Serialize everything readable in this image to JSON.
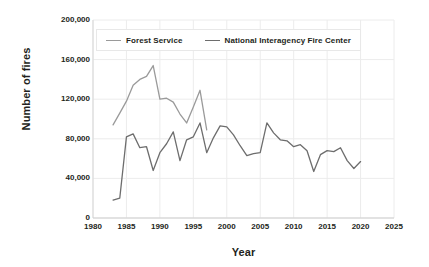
{
  "chart_data": {
    "type": "line",
    "title": "",
    "xlabel": "Year",
    "ylabel": "Number of fires",
    "xlim": [
      1980,
      2025
    ],
    "ylim": [
      0,
      200000
    ],
    "xticks": [
      1980,
      1985,
      1990,
      1995,
      2000,
      2005,
      2010,
      2015,
      2020,
      2025
    ],
    "xtick_labels": [
      "1980",
      "1985",
      "1990",
      "1995",
      "2000",
      "2005",
      "2010",
      "2015",
      "2020",
      "2025"
    ],
    "yticks": [
      0,
      40000,
      80000,
      120000,
      160000,
      200000
    ],
    "ytick_labels": [
      "0",
      "40,000",
      "80,000",
      "120,000",
      "160,000",
      "200,000"
    ],
    "grid": true,
    "legend_position": "top-left-inside",
    "series": [
      {
        "name": "Forest Service",
        "color": "#9a9a9a",
        "x": [
          1983,
          1984,
          1985,
          1986,
          1987,
          1988,
          1989,
          1990,
          1991,
          1992,
          1993,
          1994,
          1995,
          1996,
          1997
        ],
        "values": [
          94000,
          106000,
          118000,
          134000,
          140000,
          143000,
          154000,
          120000,
          121000,
          117000,
          105000,
          96000,
          112000,
          129000,
          89000
        ]
      },
      {
        "name": "National Interagency Fire Center",
        "color": "#6d6d6d",
        "x": [
          1983,
          1984,
          1985,
          1986,
          1987,
          1988,
          1989,
          1990,
          1991,
          1992,
          1993,
          1994,
          1995,
          1996,
          1997,
          1998,
          1999,
          2000,
          2001,
          2002,
          2003,
          2004,
          2005,
          2006,
          2007,
          2008,
          2009,
          2010,
          2011,
          2012,
          2013,
          2014,
          2015,
          2016,
          2017,
          2018,
          2019,
          2020
        ],
        "values": [
          18000,
          20000,
          82000,
          85000,
          71000,
          72000,
          48000,
          66000,
          75000,
          87000,
          58000,
          79000,
          82000,
          96000,
          66000,
          81000,
          93000,
          92000,
          84000,
          73000,
          63000,
          65000,
          66000,
          96000,
          86000,
          79000,
          78000,
          72000,
          74000,
          68000,
          47000,
          64000,
          68000,
          67000,
          71000,
          58000,
          50000,
          57000
        ]
      }
    ]
  },
  "axes": {
    "y_title": "Number of fires",
    "x_title": "Year"
  },
  "legend": {
    "items": [
      {
        "label": "Forest Service"
      },
      {
        "label": "National Interagency Fire Center"
      }
    ]
  }
}
